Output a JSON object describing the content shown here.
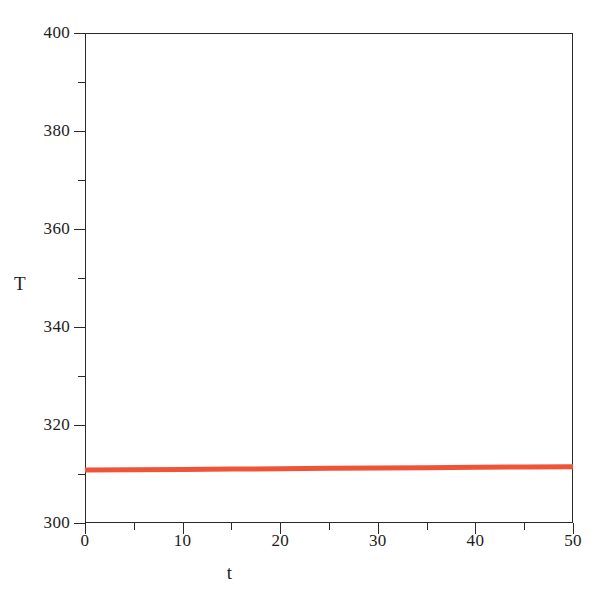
{
  "chart_data": {
    "type": "line",
    "title": "",
    "subtitle": "",
    "xlabel": "t",
    "ylabel": "T",
    "xlim": [
      0,
      50
    ],
    "ylim": [
      300,
      400
    ],
    "grid": false,
    "legend": null,
    "legend_position": "none",
    "background_color": "#ffffff",
    "axis_color": "#2a2a2a",
    "x_major_ticks": [
      0,
      10,
      20,
      30,
      40,
      50
    ],
    "x_minor_ticks": [
      5,
      15,
      25,
      35,
      45
    ],
    "y_major_ticks": [
      300,
      320,
      340,
      360,
      380,
      400
    ],
    "y_minor_ticks": [
      310,
      330,
      350,
      370,
      390
    ],
    "x_tick_labels": [
      "0",
      "10",
      "20",
      "30",
      "40",
      "50"
    ],
    "y_tick_labels": [
      "300",
      "320",
      "340",
      "360",
      "380",
      "400"
    ],
    "series": [
      {
        "name": "T(t)",
        "color": "#ef5438",
        "line_width": 5,
        "x": [
          0,
          5,
          10,
          15,
          20,
          25,
          30,
          35,
          40,
          45,
          50
        ],
        "values": [
          310.8,
          310.87,
          310.94,
          311.01,
          311.08,
          311.15,
          311.22,
          311.29,
          311.36,
          311.43,
          311.5
        ]
      }
    ],
    "annotations": []
  },
  "axes": {
    "y_title": "T",
    "x_title": "t"
  }
}
